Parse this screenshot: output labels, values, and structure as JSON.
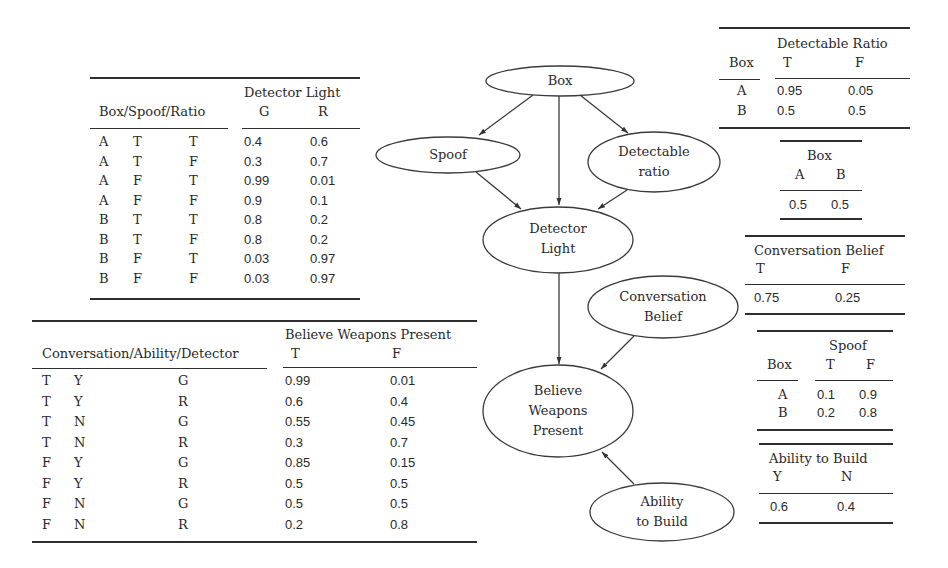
{
  "nodes": {
    "box": "Box",
    "spoof": "Spoof",
    "detectable_ratio": [
      "Detectable",
      "ratio"
    ],
    "detector_light": [
      "Detector",
      "Light"
    ],
    "conversation_belief": [
      "Conversation",
      "Belief"
    ],
    "believe_weapons_present": [
      "Believe",
      "Weapons",
      "Present"
    ],
    "ability_to_build": [
      "Ability",
      "to Build"
    ]
  },
  "edges": [
    {
      "from": "Box",
      "to": "Spoof"
    },
    {
      "from": "Box",
      "to": "Detector Light"
    },
    {
      "from": "Box",
      "to": "Detectable ratio"
    },
    {
      "from": "Spoof",
      "to": "Detector Light"
    },
    {
      "from": "Detectable ratio",
      "to": "Detector Light"
    },
    {
      "from": "Detector Light",
      "to": "Believe Weapons Present"
    },
    {
      "from": "Conversation Belief",
      "to": "Believe Weapons Present"
    },
    {
      "from": "Ability to Build",
      "to": "Believe Weapons Present"
    }
  ],
  "tables": {
    "detector_light": {
      "parent_header": "Box/Spoof/Ratio",
      "group_header": "Detector Light",
      "columns": [
        "G",
        "R"
      ],
      "rows": [
        {
          "box": "A",
          "spoof": "T",
          "ratio": "T",
          "G": "0.4",
          "R": "0.6"
        },
        {
          "box": "A",
          "spoof": "T",
          "ratio": "F",
          "G": "0.3",
          "R": "0.7"
        },
        {
          "box": "A",
          "spoof": "F",
          "ratio": "T",
          "G": "0.99",
          "R": "0.01"
        },
        {
          "box": "A",
          "spoof": "F",
          "ratio": "F",
          "G": "0.9",
          "R": "0.1"
        },
        {
          "box": "B",
          "spoof": "T",
          "ratio": "T",
          "G": "0.8",
          "R": "0.2"
        },
        {
          "box": "B",
          "spoof": "T",
          "ratio": "F",
          "G": "0.8",
          "R": "0.2"
        },
        {
          "box": "B",
          "spoof": "F",
          "ratio": "T",
          "G": "0.03",
          "R": "0.97"
        },
        {
          "box": "B",
          "spoof": "F",
          "ratio": "F",
          "G": "0.03",
          "R": "0.97"
        }
      ]
    },
    "believe_weapons_present": {
      "parent_header": "Conversation/Ability/Detector",
      "group_header": "Believe Weapons Present",
      "columns": [
        "T",
        "F"
      ],
      "rows": [
        {
          "conv": "T",
          "ability": "Y",
          "detector": "G",
          "T": "0.99",
          "F": "0.01"
        },
        {
          "conv": "T",
          "ability": "Y",
          "detector": "R",
          "T": "0.6",
          "F": "0.4"
        },
        {
          "conv": "T",
          "ability": "N",
          "detector": "G",
          "T": "0.55",
          "F": "0.45"
        },
        {
          "conv": "T",
          "ability": "N",
          "detector": "R",
          "T": "0.3",
          "F": "0.7"
        },
        {
          "conv": "F",
          "ability": "Y",
          "detector": "G",
          "T": "0.85",
          "F": "0.15"
        },
        {
          "conv": "F",
          "ability": "Y",
          "detector": "R",
          "T": "0.5",
          "F": "0.5"
        },
        {
          "conv": "F",
          "ability": "N",
          "detector": "G",
          "T": "0.5",
          "F": "0.5"
        },
        {
          "conv": "F",
          "ability": "N",
          "detector": "R",
          "T": "0.2",
          "F": "0.8"
        }
      ]
    },
    "detectable_ratio": {
      "parent_header": "Box",
      "group_header": "Detectable Ratio",
      "columns": [
        "T",
        "F"
      ],
      "rows": [
        {
          "box": "A",
          "T": "0.95",
          "F": "0.05"
        },
        {
          "box": "B",
          "T": "0.5",
          "F": "0.5"
        }
      ]
    },
    "box": {
      "group_header": "Box",
      "columns": [
        "A",
        "B"
      ],
      "values": [
        "0.5",
        "0.5"
      ]
    },
    "conversation_belief": {
      "group_header": "Conversation Belief",
      "columns": [
        "T",
        "F"
      ],
      "values": [
        "0.75",
        "0.25"
      ]
    },
    "spoof": {
      "parent_header": "Box",
      "group_header": "Spoof",
      "columns": [
        "T",
        "F"
      ],
      "rows": [
        {
          "box": "A",
          "T": "0.1",
          "F": "0.9"
        },
        {
          "box": "B",
          "T": "0.2",
          "F": "0.8"
        }
      ]
    },
    "ability_to_build": {
      "group_header": "Ability to Build",
      "columns": [
        "Y",
        "N"
      ],
      "values": [
        "0.6",
        "0.4"
      ]
    }
  }
}
